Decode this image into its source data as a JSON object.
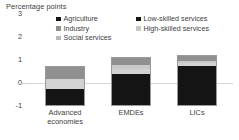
{
  "chart_data": {
    "type": "bar",
    "title": "Percentage points",
    "subtitle": "",
    "xlabel": "",
    "ylabel": "Percentage points",
    "stacked": true,
    "grid": false,
    "legend_position": "top",
    "ylim": [
      -1,
      3
    ],
    "yticks": [
      "3",
      "2",
      "1",
      "0",
      "-1"
    ],
    "ytick_values": [
      3,
      2,
      1,
      0,
      -1
    ],
    "categories": [
      "Advanced economies",
      "EMDEs",
      "LICs"
    ],
    "series": [
      {
        "name": "Agriculture",
        "color": "#101010",
        "values": [
          0.0,
          0.0,
          0.0
        ]
      },
      {
        "name": "Low-skilled services",
        "color": "#141414",
        "values": [
          0.72,
          1.42,
          1.78
        ]
      },
      {
        "name": "Social services",
        "color": "#d2d2d2",
        "values": [
          0.48,
          0.22,
          0.1
        ]
      },
      {
        "name": "High-skilled services",
        "color": "#c9c9c9",
        "values": [
          0.0,
          0.17,
          0.13
        ]
      },
      {
        "name": "Industry",
        "color": "#909090",
        "values": [
          0.55,
          0.3,
          0.22
        ]
      }
    ],
    "totals": [
      1.75,
      2.11,
      2.23
    ],
    "annotations": []
  },
  "legend": {
    "left_items": [
      {
        "label": "Agriculture",
        "color": "#121212"
      },
      {
        "label": "Industry",
        "color": "#8f8f8f"
      },
      {
        "label": "Social services",
        "color": "#b8b8b8"
      }
    ],
    "right_items": [
      {
        "label": "Low-skilled services",
        "color": "#151515"
      },
      {
        "label": "High-skilled services",
        "color": "#c7c7c7"
      }
    ]
  },
  "xlabels": [
    {
      "line1": "Advanced",
      "line2": "economies"
    },
    {
      "line1": "EMDEs",
      "line2": ""
    },
    {
      "line1": "LICs",
      "line2": ""
    }
  ]
}
